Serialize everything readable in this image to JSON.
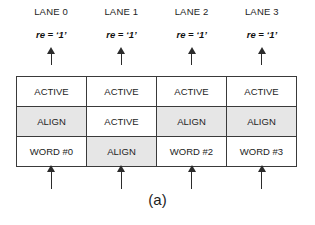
{
  "figure": {
    "caption": "(a)",
    "colors": {
      "shaded_cell": "#e6e6e6",
      "plain_cell": "#ffffff",
      "border": "#3a3a3a",
      "arrow": "#2b2b2b",
      "text": "#1d1d1d",
      "background": "#ffffff"
    }
  },
  "lanes": [
    {
      "title": "LANE 0",
      "signal": "re = ‘1’"
    },
    {
      "title": "LANE 1",
      "signal": "re = ‘1’"
    },
    {
      "title": "LANE 2",
      "signal": "re = ‘1’"
    },
    {
      "title": "LANE 3",
      "signal": "re = ‘1’"
    }
  ],
  "table": {
    "rows": [
      [
        {
          "label": "ACTIVE",
          "shaded": false
        },
        {
          "label": "ACTIVE",
          "shaded": false
        },
        {
          "label": "ACTIVE",
          "shaded": false
        },
        {
          "label": "ACTIVE",
          "shaded": false
        }
      ],
      [
        {
          "label": "ALIGN",
          "shaded": true
        },
        {
          "label": "ACTIVE",
          "shaded": false
        },
        {
          "label": "ALIGN",
          "shaded": true
        },
        {
          "label": "ALIGN",
          "shaded": true
        }
      ],
      [
        {
          "label": "WORD #0",
          "shaded": false
        },
        {
          "label": "ALIGN",
          "shaded": true
        },
        {
          "label": "WORD #2",
          "shaded": false
        },
        {
          "label": "WORD #3",
          "shaded": false
        }
      ]
    ]
  },
  "arrows": {
    "top": [
      "arrow-up-icon",
      "arrow-up-icon",
      "arrow-up-icon",
      "arrow-up-icon"
    ],
    "bottom": [
      "arrow-up-icon",
      "arrow-up-icon",
      "arrow-up-icon",
      "arrow-up-icon"
    ]
  }
}
